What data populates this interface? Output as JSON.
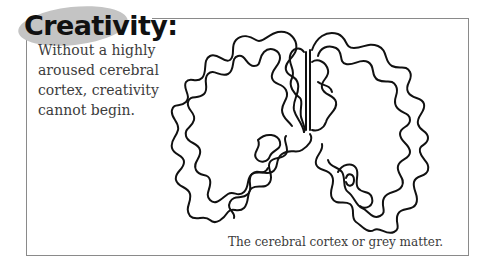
{
  "heading": {
    "title": "Creativity:",
    "highlight_color": "#c4c4c4"
  },
  "body": {
    "lines": [
      "Without a highly",
      "aroused cerebral",
      "cortex, creativity",
      "cannot begin."
    ]
  },
  "figure": {
    "illustration": "brain-coronal-section-icon",
    "caption": "The cerebral cortex or grey matter."
  }
}
